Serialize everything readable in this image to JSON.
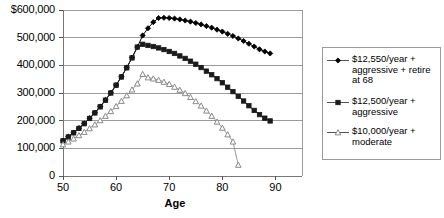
{
  "chart_data": {
    "type": "line",
    "title": "",
    "xlabel": "Age",
    "ylabel": "",
    "xlim": [
      50,
      95
    ],
    "ylim": [
      0,
      600000
    ],
    "grid": true,
    "legend_position": "right",
    "x_ticks": [
      50,
      60,
      70,
      80,
      90
    ],
    "x_tick_labels": [
      "50",
      "60",
      "70",
      "80",
      "90"
    ],
    "y_ticks": [
      0,
      100000,
      200000,
      300000,
      400000,
      500000,
      600000
    ],
    "y_tick_labels": [
      "0",
      "100,000",
      "200,000",
      "300,000",
      "400,000",
      "500,000",
      "$600,000"
    ],
    "series": [
      {
        "name": "$12,550/year + aggressive + retire at 68",
        "marker": "filled-diamond",
        "color": "#000000",
        "x": [
          50,
          51,
          52,
          53,
          54,
          55,
          56,
          57,
          58,
          59,
          60,
          61,
          62,
          63,
          64,
          65,
          66,
          67,
          68,
          69,
          70,
          71,
          72,
          73,
          74,
          75,
          76,
          77,
          78,
          79,
          80,
          81,
          82,
          83,
          84,
          85,
          86,
          87,
          88,
          89
        ],
        "y": [
          128000,
          142000,
          157000,
          173000,
          190000,
          209000,
          229000,
          251000,
          275000,
          301000,
          329000,
          359000,
          392000,
          428000,
          466000,
          508000,
          534000,
          556000,
          571000,
          572000,
          571000,
          569000,
          566000,
          562000,
          558000,
          553000,
          548000,
          542000,
          536000,
          529000,
          522000,
          514000,
          506000,
          497000,
          488000,
          478000,
          468000,
          458000,
          450000,
          443000
        ]
      },
      {
        "name": "$12,500/year + aggressive",
        "marker": "filled-square",
        "color": "#1a1a1a",
        "x": [
          50,
          51,
          52,
          53,
          54,
          55,
          56,
          57,
          58,
          59,
          60,
          61,
          62,
          63,
          64,
          65,
          66,
          67,
          68,
          69,
          70,
          71,
          72,
          73,
          74,
          75,
          76,
          77,
          78,
          79,
          80,
          81,
          82,
          83,
          84,
          85,
          86,
          87,
          88,
          89
        ],
        "y": [
          127000,
          141000,
          156000,
          172000,
          189000,
          208000,
          228000,
          250000,
          274000,
          300000,
          328000,
          358000,
          391000,
          427000,
          466000,
          476000,
          472000,
          468000,
          463000,
          457000,
          450000,
          443000,
          434000,
          425000,
          415000,
          404000,
          392000,
          379000,
          366000,
          352000,
          337000,
          321000,
          305000,
          288000,
          271000,
          254000,
          237000,
          222000,
          209000,
          199000
        ]
      },
      {
        "name": "$10,000/year + moderate",
        "marker": "open-triangle",
        "color": "#8a8a8a",
        "x": [
          50,
          51,
          52,
          53,
          54,
          55,
          56,
          57,
          58,
          59,
          60,
          61,
          62,
          63,
          64,
          65,
          66,
          67,
          68,
          69,
          70,
          71,
          72,
          73,
          74,
          75,
          76,
          77,
          78,
          79,
          80,
          81,
          82,
          83
        ],
        "y": [
          114000,
          124000,
          135000,
          147000,
          159000,
          172000,
          186000,
          201000,
          217000,
          234000,
          252000,
          271000,
          291000,
          312000,
          334000,
          368000,
          356000,
          352000,
          347000,
          340000,
          332000,
          322000,
          311000,
          299000,
          285000,
          270000,
          254000,
          236000,
          217000,
          196000,
          174000,
          150000,
          124000,
          40000
        ]
      }
    ]
  },
  "axis": {
    "x_title": "Age"
  },
  "legend": {
    "items": [
      {
        "label": "$12,550/year +\naggressive + retire\nat 68",
        "marker": "filled-diamond"
      },
      {
        "label": "$12,500/year +\naggressive",
        "marker": "filled-square"
      },
      {
        "label": "$10,000/year +\nmoderate",
        "marker": "open-triangle"
      }
    ]
  }
}
